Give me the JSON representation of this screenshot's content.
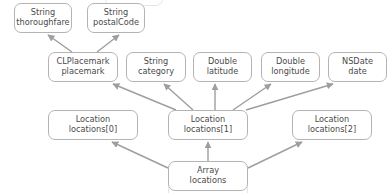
{
  "diagram": {
    "stroke_color": "#9e9e9e",
    "box_border_color": "#b4b4b4",
    "text_color": "#4a4a4a",
    "background_color": "#ffffff",
    "nodes": [
      {
        "id": "thoroughfare",
        "type_line": "String",
        "name_line": "thoroughfare",
        "x": 14,
        "y": 3,
        "w": 58,
        "h": 30
      },
      {
        "id": "postalCode",
        "type_line": "String",
        "name_line": "postalCode",
        "x": 87,
        "y": 3,
        "w": 58,
        "h": 30
      },
      {
        "id": "placemark",
        "type_line": "CLPlacemark",
        "name_line": "placemark",
        "x": 48,
        "y": 52,
        "w": 70,
        "h": 30
      },
      {
        "id": "category",
        "type_line": "String",
        "name_line": "category",
        "x": 126,
        "y": 52,
        "w": 60,
        "h": 30
      },
      {
        "id": "latitude",
        "type_line": "Double",
        "name_line": "latitude",
        "x": 193,
        "y": 52,
        "w": 59,
        "h": 30
      },
      {
        "id": "longitude",
        "type_line": "Double",
        "name_line": "longitude",
        "x": 261,
        "y": 52,
        "w": 59,
        "h": 30
      },
      {
        "id": "date",
        "type_line": "NSDate",
        "name_line": "date",
        "x": 328,
        "y": 52,
        "w": 59,
        "h": 30
      },
      {
        "id": "locations0",
        "type_line": "Location",
        "name_line": "locations[0]",
        "x": 48,
        "y": 110,
        "w": 90,
        "h": 30
      },
      {
        "id": "locations1",
        "type_line": "Location",
        "name_line": "locations[1]",
        "x": 168,
        "y": 110,
        "w": 80,
        "h": 30
      },
      {
        "id": "locations2",
        "type_line": "Location",
        "name_line": "locations[2]",
        "x": 292,
        "y": 110,
        "w": 80,
        "h": 30
      },
      {
        "id": "array",
        "type_line": "Array",
        "name_line": "locations",
        "x": 168,
        "y": 161,
        "w": 80,
        "h": 30
      }
    ],
    "edges": [
      {
        "from": "placemark",
        "to": "thoroughfare",
        "x1": 72,
        "y1": 52,
        "x2": 48,
        "y2": 35
      },
      {
        "from": "placemark",
        "to": "postalCode",
        "x1": 97,
        "y1": 52,
        "x2": 119,
        "y2": 35
      },
      {
        "from": "locations1",
        "to": "placemark",
        "x1": 176,
        "y1": 110,
        "x2": 113,
        "y2": 84
      },
      {
        "from": "locations1",
        "to": "category",
        "x1": 193,
        "y1": 110,
        "x2": 164,
        "y2": 84
      },
      {
        "from": "locations1",
        "to": "latitude",
        "x1": 215,
        "y1": 110,
        "x2": 215,
        "y2": 84
      },
      {
        "from": "locations1",
        "to": "longitude",
        "x1": 233,
        "y1": 110,
        "x2": 271,
        "y2": 84
      },
      {
        "from": "locations1",
        "to": "date",
        "x1": 246,
        "y1": 110,
        "x2": 333,
        "y2": 84
      },
      {
        "from": "array",
        "to": "locations0",
        "x1": 168,
        "y1": 168,
        "x2": 112,
        "y2": 142
      },
      {
        "from": "array",
        "to": "locations1",
        "x1": 208,
        "y1": 161,
        "x2": 208,
        "y2": 142
      },
      {
        "from": "array",
        "to": "locations2",
        "x1": 248,
        "y1": 168,
        "x2": 302,
        "y2": 142
      }
    ],
    "clipped": {
      "top_partial_label": "",
      "bottom_partial_label": ""
    }
  }
}
